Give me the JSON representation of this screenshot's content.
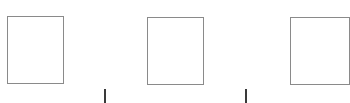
{
  "canvas": {
    "width": 338,
    "height": 103,
    "background": "#ffffff"
  },
  "boxes": [
    {
      "id": "box-1",
      "x": 7,
      "y": 16,
      "w": 57,
      "h": 68,
      "border": "#8a8a8a"
    },
    {
      "id": "box-2",
      "x": 147,
      "y": 17,
      "w": 57,
      "h": 68,
      "border": "#8a8a8a"
    },
    {
      "id": "box-3",
      "x": 290,
      "y": 17,
      "w": 60,
      "h": 68,
      "border": "#8a8a8a"
    }
  ],
  "separators": [
    {
      "id": "separator-1",
      "x": 104,
      "y": 89,
      "h": 14,
      "color": "#3a3a3a"
    },
    {
      "id": "separator-2",
      "x": 245,
      "y": 89,
      "h": 14,
      "color": "#3a3a3a"
    }
  ]
}
